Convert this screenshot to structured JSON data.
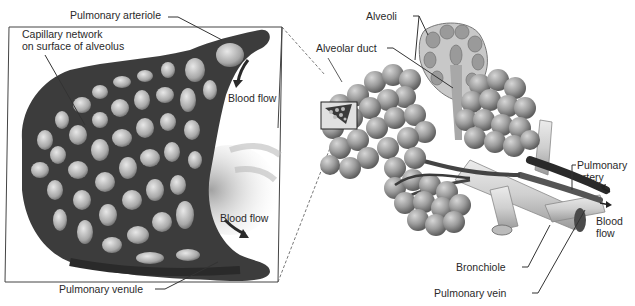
{
  "figure": {
    "left_panel": {
      "title": "Magnified capillary network",
      "labels": {
        "pulmonary_arteriole": "Pulmonary arteriole",
        "capillary_network_line1": "Capillary network",
        "capillary_network_line2": "on surface of alveolus",
        "blood_flow_top": "Blood flow",
        "blood_flow_bottom": "Blood flow",
        "pulmonary_venule": "Pulmonary venule"
      }
    },
    "right_panel": {
      "title": "Alveolar sacs and bronchiole",
      "labels": {
        "alveoli": "Alveoli",
        "alveolar_duct": "Alveolar duct",
        "pulmonary_artery_line1": "Pulmonary",
        "pulmonary_artery_line2": "artery",
        "blood_flow_line1": "Blood",
        "blood_flow_line2": "flow",
        "bronchiole": "Bronchiole",
        "pulmonary_vein": "Pulmonary vein"
      }
    },
    "colors": {
      "vessel_dark": "#3a3a3a",
      "vessel_mid": "#5a5a5a",
      "alveolus_fill": "#9a9a9a",
      "alveolus_highlight": "#c8c8c8",
      "bronchiole_fill": "#d8d8d8",
      "leader_line": "#333333",
      "box_border": "#444444"
    }
  }
}
